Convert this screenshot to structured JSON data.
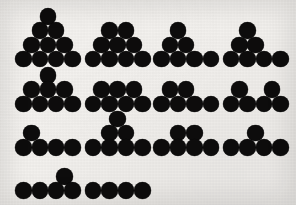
{
  "figure": {
    "canvas": {
      "width": 296,
      "height": 205
    },
    "background_color": "#f3f1ee",
    "disc_color": "#0d0c0c",
    "disc_diameter": 16.5,
    "total_shapes": 14,
    "total_discs": 86
  },
  "shapes": [
    {
      "id": "shape-1",
      "name": "triangle-ten",
      "row": 1,
      "column": 1,
      "disc_count": 10,
      "row_counts": [
        1,
        2,
        3,
        4
      ],
      "discs": [
        {
          "cx": 48.0,
          "cy": 16.5
        },
        {
          "cx": 39.8,
          "cy": 30.7
        },
        {
          "cx": 56.2,
          "cy": 30.7
        },
        {
          "cx": 31.6,
          "cy": 44.9
        },
        {
          "cx": 48.0,
          "cy": 44.9
        },
        {
          "cx": 64.4,
          "cy": 44.9
        },
        {
          "cx": 23.4,
          "cy": 59.1
        },
        {
          "cx": 39.8,
          "cy": 59.1
        },
        {
          "cx": 56.2,
          "cy": 59.1
        },
        {
          "cx": 72.6,
          "cy": 59.1
        }
      ]
    },
    {
      "id": "shape-2",
      "name": "trapezoid-nine",
      "row": 1,
      "column": 2,
      "disc_count": 9,
      "row_counts": [
        2,
        3,
        4
      ],
      "discs": [
        {
          "cx": 109.5,
          "cy": 30.7
        },
        {
          "cx": 125.9,
          "cy": 30.7
        },
        {
          "cx": 101.3,
          "cy": 44.9
        },
        {
          "cx": 117.7,
          "cy": 44.9
        },
        {
          "cx": 134.1,
          "cy": 44.9
        },
        {
          "cx": 93.1,
          "cy": 59.1
        },
        {
          "cx": 109.5,
          "cy": 59.1
        },
        {
          "cx": 125.9,
          "cy": 59.1
        },
        {
          "cx": 142.3,
          "cy": 59.1
        }
      ]
    },
    {
      "id": "shape-3",
      "name": "pyramid-plus-tail-seven",
      "row": 1,
      "column": 3,
      "disc_count": 7,
      "row_counts": [
        1,
        2,
        4
      ],
      "discs": [
        {
          "cx": 178.0,
          "cy": 30.7
        },
        {
          "cx": 169.8,
          "cy": 44.9
        },
        {
          "cx": 186.2,
          "cy": 44.9
        },
        {
          "cx": 161.6,
          "cy": 59.1
        },
        {
          "cx": 178.0,
          "cy": 59.1
        },
        {
          "cx": 194.4,
          "cy": 59.1
        },
        {
          "cx": 210.8,
          "cy": 59.1
        }
      ]
    },
    {
      "id": "shape-4",
      "name": "stack-left-seven",
      "row": 1,
      "column": 4,
      "disc_count": 7,
      "row_counts": [
        1,
        2,
        4
      ],
      "discs": [
        {
          "cx": 247.5,
          "cy": 30.7
        },
        {
          "cx": 239.3,
          "cy": 44.9
        },
        {
          "cx": 255.7,
          "cy": 44.9
        },
        {
          "cx": 231.1,
          "cy": 59.1
        },
        {
          "cx": 247.5,
          "cy": 59.1
        },
        {
          "cx": 263.9,
          "cy": 59.1
        },
        {
          "cx": 280.3,
          "cy": 59.1
        }
      ]
    },
    {
      "id": "shape-5",
      "name": "peak-right-eight",
      "row": 2,
      "column": 1,
      "disc_count": 8,
      "row_counts": [
        1,
        3,
        4
      ],
      "discs": [
        {
          "cx": 48.0,
          "cy": 75.5
        },
        {
          "cx": 31.6,
          "cy": 89.7
        },
        {
          "cx": 48.0,
          "cy": 89.7
        },
        {
          "cx": 64.4,
          "cy": 89.7
        },
        {
          "cx": 23.4,
          "cy": 103.9
        },
        {
          "cx": 39.8,
          "cy": 103.9
        },
        {
          "cx": 56.2,
          "cy": 103.9
        },
        {
          "cx": 72.6,
          "cy": 103.9
        }
      ]
    },
    {
      "id": "shape-6",
      "name": "double-row-seven",
      "row": 2,
      "column": 2,
      "disc_count": 7,
      "row_counts": [
        3,
        4
      ],
      "discs": [
        {
          "cx": 101.3,
          "cy": 89.7
        },
        {
          "cx": 117.7,
          "cy": 89.7
        },
        {
          "cx": 134.1,
          "cy": 89.7
        },
        {
          "cx": 93.1,
          "cy": 103.9
        },
        {
          "cx": 109.5,
          "cy": 103.9
        },
        {
          "cx": 125.9,
          "cy": 103.9
        },
        {
          "cx": 142.3,
          "cy": 103.9
        }
      ]
    },
    {
      "id": "shape-7",
      "name": "pair-left-six",
      "row": 2,
      "column": 3,
      "disc_count": 6,
      "row_counts": [
        2,
        4
      ],
      "discs": [
        {
          "cx": 169.8,
          "cy": 89.7
        },
        {
          "cx": 186.2,
          "cy": 89.7
        },
        {
          "cx": 161.6,
          "cy": 103.9
        },
        {
          "cx": 178.0,
          "cy": 103.9
        },
        {
          "cx": 194.4,
          "cy": 103.9
        },
        {
          "cx": 210.8,
          "cy": 103.9
        }
      ]
    },
    {
      "id": "shape-8",
      "name": "split-pair-six",
      "row": 2,
      "column": 4,
      "disc_count": 6,
      "row_counts": [
        2,
        4
      ],
      "discs": [
        {
          "cx": 239.3,
          "cy": 89.7
        },
        {
          "cx": 272.1,
          "cy": 89.7
        },
        {
          "cx": 231.1,
          "cy": 103.9
        },
        {
          "cx": 247.5,
          "cy": 103.9
        },
        {
          "cx": 263.9,
          "cy": 103.9
        },
        {
          "cx": 280.3,
          "cy": 103.9
        }
      ]
    },
    {
      "id": "shape-9",
      "name": "single-left-five",
      "row": 3,
      "column": 1,
      "disc_count": 5,
      "row_counts": [
        1,
        4
      ],
      "discs": [
        {
          "cx": 31.6,
          "cy": 133.1
        },
        {
          "cx": 23.4,
          "cy": 147.3
        },
        {
          "cx": 39.8,
          "cy": 147.3
        },
        {
          "cx": 56.2,
          "cy": 147.3
        },
        {
          "cx": 72.6,
          "cy": 147.3
        }
      ]
    },
    {
      "id": "shape-10",
      "name": "tall-peak-seven",
      "row": 3,
      "column": 2,
      "disc_count": 7,
      "row_counts": [
        1,
        2,
        4
      ],
      "discs": [
        {
          "cx": 117.7,
          "cy": 118.9
        },
        {
          "cx": 109.5,
          "cy": 133.1
        },
        {
          "cx": 125.9,
          "cy": 133.1
        },
        {
          "cx": 93.1,
          "cy": 147.3
        },
        {
          "cx": 109.5,
          "cy": 147.3
        },
        {
          "cx": 125.9,
          "cy": 147.3
        },
        {
          "cx": 142.3,
          "cy": 147.3
        }
      ]
    },
    {
      "id": "shape-11",
      "name": "pair-center-six",
      "row": 3,
      "column": 3,
      "disc_count": 6,
      "row_counts": [
        2,
        4
      ],
      "discs": [
        {
          "cx": 178.0,
          "cy": 133.1
        },
        {
          "cx": 194.4,
          "cy": 133.1
        },
        {
          "cx": 161.6,
          "cy": 147.3
        },
        {
          "cx": 178.0,
          "cy": 147.3
        },
        {
          "cx": 194.4,
          "cy": 147.3
        },
        {
          "cx": 210.8,
          "cy": 147.3
        }
      ]
    },
    {
      "id": "shape-12",
      "name": "single-center-five",
      "row": 3,
      "column": 4,
      "disc_count": 5,
      "row_counts": [
        1,
        4
      ],
      "discs": [
        {
          "cx": 255.7,
          "cy": 133.1
        },
        {
          "cx": 231.1,
          "cy": 147.3
        },
        {
          "cx": 247.5,
          "cy": 147.3
        },
        {
          "cx": 263.9,
          "cy": 147.3
        },
        {
          "cx": 280.3,
          "cy": 147.3
        }
      ]
    },
    {
      "id": "shape-13",
      "name": "single-right-five",
      "row": 4,
      "column": 1,
      "disc_count": 5,
      "row_counts": [
        1,
        4
      ],
      "discs": [
        {
          "cx": 64.4,
          "cy": 176.5
        },
        {
          "cx": 23.4,
          "cy": 190.7
        },
        {
          "cx": 39.8,
          "cy": 190.7
        },
        {
          "cx": 56.2,
          "cy": 190.7
        },
        {
          "cx": 72.6,
          "cy": 190.7
        }
      ]
    },
    {
      "id": "shape-14",
      "name": "straight-line-four",
      "row": 4,
      "column": 2,
      "disc_count": 4,
      "row_counts": [
        4
      ],
      "discs": [
        {
          "cx": 93.1,
          "cy": 190.7
        },
        {
          "cx": 109.5,
          "cy": 190.7
        },
        {
          "cx": 125.9,
          "cy": 190.7
        },
        {
          "cx": 142.3,
          "cy": 190.7
        }
      ]
    }
  ]
}
